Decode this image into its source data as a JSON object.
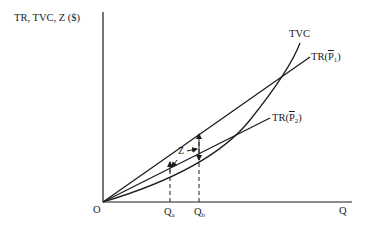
{
  "diagram": {
    "y_axis_label": "TR, TVC, Z ($)",
    "x_axis_label": "Q",
    "origin_label": "O",
    "curves": [
      {
        "id": "tvc",
        "label": "TVC",
        "type": "convex curve"
      },
      {
        "id": "tr_p1",
        "label_main": "TR(",
        "label_var": "P",
        "label_sub": "1",
        "label_close": ")",
        "type": "straight line from origin"
      },
      {
        "id": "tr_p2",
        "label_main": "TR(",
        "label_var": "P",
        "label_sub": "2",
        "label_close": ")",
        "type": "straight line from origin"
      }
    ],
    "quantity_marks": [
      {
        "id": "qa",
        "label_main": "Q",
        "label_sub": "a"
      },
      {
        "id": "qb",
        "label_main": "Q",
        "label_sub": "b"
      }
    ],
    "annotation": {
      "label": "Z",
      "description": "vertical gap between TR and TVC"
    },
    "colors": {
      "line": "#1c1c1c",
      "background": "#ffffff"
    }
  }
}
